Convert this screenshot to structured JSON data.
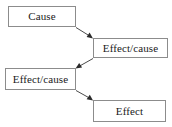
{
  "diagram": {
    "background_color": "#ffffff",
    "box_border_color": "#8c8c8c",
    "box_fill_color": "#ffffff",
    "text_color": "#1a1a1a",
    "arrow_color": "#4a4a4a",
    "arrowhead_color": "#2b2b2b",
    "nodes": [
      {
        "id": "node-1",
        "label": "Cause",
        "x": 8,
        "y": 6,
        "width": 68,
        "height": 21
      },
      {
        "id": "node-2",
        "label": "Effect/cause",
        "x": 93,
        "y": 38,
        "width": 75,
        "height": 20
      },
      {
        "id": "node-3",
        "label": "Effect/cause",
        "x": 5,
        "y": 68,
        "width": 71,
        "height": 22
      },
      {
        "id": "node-4",
        "label": "Effect",
        "x": 93,
        "y": 100,
        "width": 73,
        "height": 22
      }
    ],
    "edges": [
      {
        "id": "edge-1",
        "from": "node-1",
        "to": "node-2",
        "direction": "down-right"
      },
      {
        "id": "edge-2",
        "from": "node-2",
        "to": "node-3",
        "direction": "down-left"
      },
      {
        "id": "edge-3",
        "from": "node-3",
        "to": "node-4",
        "direction": "down-right"
      }
    ]
  }
}
